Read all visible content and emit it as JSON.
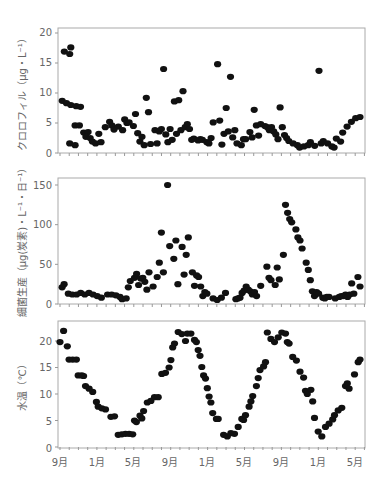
{
  "chart_data": [
    {
      "type": "scatter",
      "title": "",
      "ylabel": "クロロフィル（μg・L⁻¹）",
      "xlabel": "",
      "ylim": [
        0,
        20
      ],
      "yticks": [
        0,
        5,
        10,
        15,
        20
      ],
      "xtick_labels": [
        "9月",
        "1月",
        "5月",
        "9月",
        "1月",
        "5月",
        "9月",
        "1月",
        "5月"
      ],
      "x_unit": "months since Sep (year 1)",
      "grid": false,
      "points": [
        [
          0.1,
          8.7
        ],
        [
          0.3,
          8.3
        ],
        [
          0.5,
          8.0
        ],
        [
          0.2,
          16.9
        ],
        [
          0.5,
          17.6
        ],
        [
          0.45,
          16.5
        ],
        [
          0.45,
          1.6
        ],
        [
          0.7,
          1.3
        ],
        [
          0.75,
          7.8
        ],
        [
          0.95,
          7.7
        ],
        [
          0.7,
          4.6
        ],
        [
          0.9,
          4.6
        ],
        [
          1.1,
          3.4
        ],
        [
          1.3,
          3.5
        ],
        [
          1.2,
          2.7
        ],
        [
          1.4,
          2.5
        ],
        [
          1.5,
          1.9
        ],
        [
          1.65,
          1.6
        ],
        [
          1.8,
          3.2
        ],
        [
          1.9,
          1.8
        ],
        [
          2.1,
          4.3
        ],
        [
          2.3,
          5.2
        ],
        [
          2.4,
          4.6
        ],
        [
          2.5,
          3.9
        ],
        [
          2.7,
          4.4
        ],
        [
          2.9,
          3.8
        ],
        [
          3.0,
          5.6
        ],
        [
          3.1,
          5.0
        ],
        [
          3.2,
          5.1
        ],
        [
          3.4,
          4.5
        ],
        [
          3.5,
          6.5
        ],
        [
          3.6,
          3.3
        ],
        [
          3.7,
          1.9
        ],
        [
          3.8,
          2.7
        ],
        [
          3.9,
          1.3
        ],
        [
          4.0,
          9.2
        ],
        [
          4.1,
          6.8
        ],
        [
          4.2,
          1.5
        ],
        [
          4.4,
          3.8
        ],
        [
          4.5,
          1.6
        ],
        [
          4.6,
          3.6
        ],
        [
          4.7,
          4.0
        ],
        [
          4.8,
          14.0
        ],
        [
          4.9,
          3.1
        ],
        [
          5.0,
          1.8
        ],
        [
          5.1,
          4.0
        ],
        [
          5.2,
          2.2
        ],
        [
          5.3,
          8.6
        ],
        [
          5.4,
          3.2
        ],
        [
          5.5,
          8.8
        ],
        [
          5.6,
          3.8
        ],
        [
          5.7,
          10.3
        ],
        [
          5.8,
          4.3
        ],
        [
          5.9,
          4.8
        ],
        [
          6.0,
          4.0
        ],
        [
          6.1,
          2.2
        ],
        [
          6.2,
          2.4
        ],
        [
          6.4,
          2.1
        ],
        [
          6.5,
          2.3
        ],
        [
          6.6,
          2.2
        ],
        [
          6.8,
          1.8
        ],
        [
          6.9,
          1.6
        ],
        [
          7.0,
          2.5
        ],
        [
          7.1,
          5.1
        ],
        [
          7.3,
          14.8
        ],
        [
          7.4,
          5.4
        ],
        [
          7.5,
          1.4
        ],
        [
          7.6,
          3.2
        ],
        [
          7.7,
          7.5
        ],
        [
          7.8,
          3.6
        ],
        [
          7.9,
          12.7
        ],
        [
          8.0,
          2.6
        ],
        [
          8.1,
          3.8
        ],
        [
          8.2,
          1.6
        ],
        [
          8.4,
          1.3
        ],
        [
          8.5,
          2.3
        ],
        [
          8.6,
          2.3
        ],
        [
          8.8,
          3.5
        ],
        [
          8.9,
          2.6
        ],
        [
          9.0,
          7.2
        ],
        [
          9.1,
          4.6
        ],
        [
          9.2,
          2.9
        ],
        [
          9.3,
          4.8
        ],
        [
          9.5,
          4.5
        ],
        [
          9.6,
          4.3
        ],
        [
          9.7,
          3.8
        ],
        [
          9.8,
          4.3
        ],
        [
          9.9,
          3.6
        ],
        [
          10.0,
          3.1
        ],
        [
          10.1,
          2.3
        ],
        [
          10.2,
          7.6
        ],
        [
          10.3,
          4.3
        ],
        [
          10.4,
          3.0
        ],
        [
          10.5,
          2.5
        ],
        [
          10.6,
          2.0
        ],
        [
          10.8,
          1.6
        ],
        [
          11.0,
          1.3
        ],
        [
          11.1,
          0.9
        ],
        [
          11.3,
          1.1
        ],
        [
          11.5,
          1.3
        ],
        [
          11.6,
          1.8
        ],
        [
          11.8,
          1.2
        ],
        [
          12.0,
          13.7
        ],
        [
          12.1,
          1.6
        ],
        [
          12.2,
          2.0
        ],
        [
          12.4,
          1.6
        ],
        [
          12.6,
          1.1
        ],
        [
          12.7,
          0.9
        ],
        [
          12.8,
          2.4
        ],
        [
          13.0,
          1.9
        ],
        [
          13.1,
          3.4
        ],
        [
          13.3,
          4.4
        ],
        [
          13.5,
          5.2
        ],
        [
          13.7,
          5.8
        ],
        [
          13.9,
          6.0
        ]
      ]
    },
    {
      "type": "scatter",
      "title": "",
      "ylabel": "細菌生産（μg(炭素)・L⁻¹・日⁻¹）",
      "xlabel": "",
      "ylim": [
        0,
        150
      ],
      "yticks": [
        0,
        50,
        100,
        150
      ],
      "xtick_labels": [
        "9月",
        "1月",
        "5月",
        "9月",
        "1月",
        "5月",
        "9月",
        "1月",
        "5月"
      ],
      "grid": false,
      "points": [
        [
          0.1,
          21
        ],
        [
          0.2,
          25
        ],
        [
          0.4,
          13
        ],
        [
          0.6,
          12
        ],
        [
          0.8,
          12
        ],
        [
          1.0,
          14
        ],
        [
          1.2,
          12
        ],
        [
          1.4,
          14
        ],
        [
          1.6,
          12
        ],
        [
          1.8,
          10
        ],
        [
          2.0,
          8
        ],
        [
          2.3,
          12
        ],
        [
          2.5,
          12
        ],
        [
          2.7,
          11
        ],
        [
          2.9,
          9
        ],
        [
          3.0,
          6
        ],
        [
          3.2,
          7
        ],
        [
          3.3,
          21
        ],
        [
          3.4,
          29
        ],
        [
          3.6,
          33
        ],
        [
          3.7,
          38
        ],
        [
          3.8,
          24
        ],
        [
          3.9,
          32
        ],
        [
          4.0,
          33
        ],
        [
          4.1,
          28
        ],
        [
          4.2,
          18
        ],
        [
          4.3,
          40
        ],
        [
          4.5,
          22
        ],
        [
          4.7,
          34
        ],
        [
          4.8,
          52
        ],
        [
          4.9,
          90
        ],
        [
          5.0,
          40
        ],
        [
          5.2,
          150
        ],
        [
          5.3,
          73
        ],
        [
          5.5,
          57
        ],
        [
          5.6,
          80
        ],
        [
          5.7,
          25
        ],
        [
          5.9,
          72
        ],
        [
          6.0,
          37
        ],
        [
          6.1,
          62
        ],
        [
          6.2,
          84
        ],
        [
          6.4,
          40
        ],
        [
          6.5,
          23
        ],
        [
          6.6,
          36
        ],
        [
          6.7,
          34
        ],
        [
          6.8,
          22
        ],
        [
          6.9,
          10
        ],
        [
          7.0,
          15
        ],
        [
          7.1,
          13
        ],
        [
          7.4,
          7
        ],
        [
          7.6,
          5
        ],
        [
          7.8,
          8
        ],
        [
          8.0,
          14
        ],
        [
          8.5,
          6
        ],
        [
          8.6,
          7
        ],
        [
          8.7,
          8
        ],
        [
          8.8,
          14
        ],
        [
          8.9,
          17
        ],
        [
          9.0,
          22
        ],
        [
          9.1,
          18
        ],
        [
          9.2,
          16
        ],
        [
          9.3,
          12
        ],
        [
          9.4,
          15
        ],
        [
          9.5,
          10
        ],
        [
          9.7,
          23
        ],
        [
          10.0,
          47
        ],
        [
          10.1,
          33
        ],
        [
          10.2,
          30
        ],
        [
          10.4,
          24
        ],
        [
          10.5,
          46
        ],
        [
          10.6,
          31
        ],
        [
          10.8,
          62
        ],
        [
          10.9,
          125
        ],
        [
          11.0,
          115
        ],
        [
          11.1,
          107
        ],
        [
          11.2,
          103
        ],
        [
          11.4,
          94
        ],
        [
          11.5,
          84
        ],
        [
          11.6,
          80
        ],
        [
          11.7,
          70
        ],
        [
          11.9,
          52
        ],
        [
          12.0,
          43
        ],
        [
          12.1,
          30
        ],
        [
          12.2,
          16
        ],
        [
          12.3,
          10
        ],
        [
          12.4,
          15
        ],
        [
          12.5,
          13
        ],
        [
          12.7,
          8
        ],
        [
          12.8,
          7
        ],
        [
          12.9,
          9
        ],
        [
          13.0,
          9
        ],
        [
          13.3,
          7
        ],
        [
          13.5,
          9
        ],
        [
          13.6,
          10
        ],
        [
          13.7,
          10
        ],
        [
          13.8,
          12
        ],
        [
          13.9,
          9
        ],
        [
          14.0,
          12
        ],
        [
          14.1,
          26
        ],
        [
          14.2,
          13
        ],
        [
          14.4,
          34
        ],
        [
          14.5,
          22
        ]
      ]
    },
    {
      "type": "scatter",
      "title": "",
      "ylabel": "水温（℃）",
      "xlabel": "",
      "ylim": [
        0,
        20
      ],
      "yticks": [
        0,
        5,
        10,
        15,
        20
      ],
      "xtick_labels": [
        "9月",
        "1月",
        "5月",
        "9月",
        "1月",
        "5月",
        "9月",
        "1月",
        "5月"
      ],
      "grid": false,
      "points": [
        [
          0.0,
          19.8
        ],
        [
          0.2,
          21.9
        ],
        [
          0.4,
          19.0
        ],
        [
          0.5,
          16.5
        ],
        [
          0.7,
          16.5
        ],
        [
          0.9,
          16.5
        ],
        [
          1.0,
          13.5
        ],
        [
          1.2,
          13.5
        ],
        [
          1.3,
          13.4
        ],
        [
          1.4,
          11.5
        ],
        [
          1.6,
          11.0
        ],
        [
          1.8,
          10.4
        ],
        [
          2.0,
          8.5
        ],
        [
          2.1,
          7.6
        ],
        [
          2.3,
          7.3
        ],
        [
          2.5,
          7.1
        ],
        [
          2.8,
          5.7
        ],
        [
          3.0,
          5.8
        ],
        [
          3.2,
          2.3
        ],
        [
          3.4,
          2.4
        ],
        [
          3.6,
          2.5
        ],
        [
          3.8,
          2.5
        ],
        [
          4.0,
          2.4
        ],
        [
          4.1,
          5.0
        ],
        [
          4.2,
          4.7
        ],
        [
          4.4,
          5.9
        ],
        [
          4.5,
          5.4
        ],
        [
          4.6,
          6.8
        ],
        [
          4.8,
          8.4
        ],
        [
          5.0,
          8.7
        ],
        [
          5.2,
          9.4
        ],
        [
          5.4,
          9.4
        ],
        [
          5.6,
          13.8
        ],
        [
          5.8,
          14.0
        ],
        [
          6.0,
          15.0
        ],
        [
          6.1,
          16.4
        ],
        [
          6.2,
          18.8
        ],
        [
          6.3,
          19.5
        ],
        [
          6.5,
          21.7
        ],
        [
          6.7,
          21.3
        ],
        [
          6.9,
          20.0
        ],
        [
          7.0,
          21.4
        ],
        [
          7.2,
          21.4
        ],
        [
          7.4,
          20.2
        ],
        [
          7.5,
          19.8
        ],
        [
          7.6,
          18.3
        ],
        [
          7.7,
          17.2
        ],
        [
          7.8,
          15.1
        ],
        [
          7.9,
          13.5
        ],
        [
          8.0,
          12.9
        ],
        [
          8.1,
          11.1
        ],
        [
          8.2,
          9.5
        ],
        [
          8.3,
          8.4
        ],
        [
          8.4,
          6.4
        ],
        [
          8.6,
          5.3
        ],
        [
          8.7,
          5.3
        ],
        [
          9.0,
          2.3
        ],
        [
          9.2,
          2.0
        ],
        [
          9.4,
          2.6
        ],
        [
          9.6,
          2.5
        ],
        [
          9.8,
          3.8
        ],
        [
          10.0,
          5.3
        ],
        [
          10.1,
          5.1
        ],
        [
          10.2,
          6.0
        ],
        [
          10.4,
          7.6
        ],
        [
          10.5,
          8.6
        ],
        [
          10.6,
          9.6
        ],
        [
          10.8,
          11.5
        ],
        [
          10.9,
          13.0
        ],
        [
          11.0,
          14.5
        ],
        [
          11.2,
          15.2
        ],
        [
          11.3,
          16.0
        ],
        [
          11.4,
          21.6
        ],
        [
          11.6,
          20.4
        ],
        [
          11.8,
          19.8
        ],
        [
          12.0,
          20.7
        ],
        [
          12.2,
          21.6
        ],
        [
          12.4,
          21.4
        ],
        [
          12.5,
          19.8
        ],
        [
          12.6,
          19.5
        ],
        [
          12.8,
          17.0
        ],
        [
          13.0,
          16.3
        ],
        [
          13.2,
          14.2
        ],
        [
          13.4,
          13.1
        ],
        [
          13.5,
          10.6
        ],
        [
          13.6,
          10.0
        ],
        [
          13.8,
          10.8
        ],
        [
          13.9,
          8.6
        ],
        [
          14.0,
          5.5
        ],
        [
          14.2,
          2.9
        ],
        [
          14.4,
          2.0
        ],
        [
          14.6,
          3.8
        ],
        [
          14.8,
          4.4
        ],
        [
          15.0,
          5.2
        ],
        [
          15.1,
          6.0
        ],
        [
          15.3,
          6.9
        ],
        [
          15.5,
          7.4
        ],
        [
          15.7,
          11.5
        ],
        [
          15.8,
          12.0
        ],
        [
          15.9,
          11.0
        ],
        [
          16.2,
          13.7
        ],
        [
          16.4,
          16.0
        ],
        [
          16.5,
          16.5
        ]
      ]
    }
  ],
  "axes": {
    "x_labels": [
      "9月",
      "1月",
      "5月",
      "9月",
      "1月",
      "5月",
      "9月",
      "1月",
      "5月"
    ],
    "panel1": {
      "ylabel": "クロロフィル（μg・L⁻¹）",
      "ticks": [
        "0",
        "5",
        "10",
        "15",
        "20"
      ]
    },
    "panel2": {
      "ylabel": "細菌生産（μg(炭素)・L⁻¹・日⁻¹）",
      "ticks": [
        "0",
        "50",
        "100",
        "150"
      ]
    },
    "panel3": {
      "ylabel": "水温（℃）",
      "ticks": [
        "0",
        "5",
        "10",
        "15",
        "20"
      ]
    }
  },
  "colors": {
    "marker": "#111111",
    "frame": "#aaaaaa",
    "text": "#666666"
  }
}
